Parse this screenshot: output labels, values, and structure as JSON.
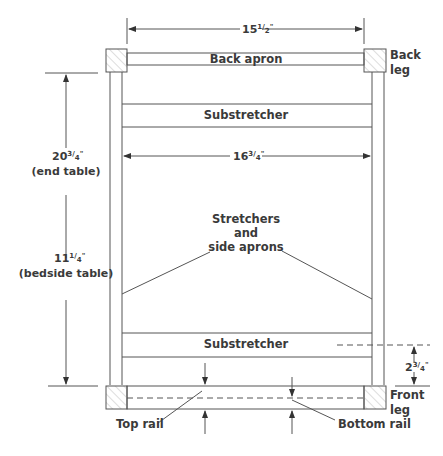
{
  "labels": {
    "back_apron": "Back apron",
    "back_leg_1": "Back",
    "back_leg_2": "leg",
    "substretcher_top": "Substretcher",
    "substretcher_bottom": "Substretcher",
    "stretchers_1": "Stretchers",
    "stretchers_2": "and",
    "stretchers_3": "side aprons",
    "front_leg_1": "Front",
    "front_leg_2": "leg",
    "top_rail": "Top rail",
    "bottom_rail": "Bottom rail"
  },
  "dimensions": {
    "width_outer": {
      "whole": "15",
      "frac_num": "1",
      "frac_den": "2",
      "unit": "\""
    },
    "width_inner": {
      "whole": "16",
      "frac_num": "3",
      "frac_den": "4",
      "unit": "\""
    },
    "height_end_table": {
      "whole": "20",
      "frac_num": "3",
      "frac_den": "4",
      "unit": "\"",
      "note": "(end table)"
    },
    "height_bedside_table": {
      "whole": "11",
      "frac_num": "1",
      "frac_den": "4",
      "unit": "\"",
      "note": "(bedside table)"
    },
    "substretcher_offset": {
      "whole": "2",
      "frac_num": "3",
      "frac_den": "4",
      "unit": "\""
    }
  },
  "colors": {
    "line": "#555555",
    "text": "#3a3a3a",
    "hatch": "#aaaaaa"
  }
}
